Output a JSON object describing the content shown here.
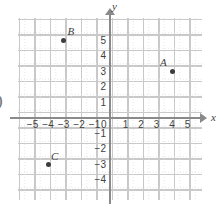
{
  "edge_artifact": ")",
  "chart_data": {
    "type": "scatter",
    "title": "",
    "xlabel": "x",
    "ylabel": "y",
    "xlim": [
      -5.6,
      5.9
    ],
    "ylim": [
      -4.6,
      5.6
    ],
    "grid": true,
    "grid_major_step": 1,
    "grid_minor_step": 0.5,
    "legend": "none",
    "origin_label": "0",
    "xticks": [
      -5,
      -4,
      -3,
      -2,
      -1,
      1,
      2,
      3,
      4,
      5
    ],
    "xtick_labels": [
      "−5",
      "−4",
      "−3",
      "−2",
      "−1",
      "1",
      "2",
      "3",
      "4",
      "5"
    ],
    "yticks": [
      5,
      4,
      3,
      2,
      1,
      -1,
      -2,
      -3,
      -4
    ],
    "ytick_labels": [
      "5",
      "4",
      "3",
      "2",
      "1",
      "−1",
      "−2",
      "−3",
      "−4"
    ],
    "points": [
      {
        "label": "A",
        "x": 4,
        "y": 3,
        "label_dx": -12,
        "label_dy": -15
      },
      {
        "label": "B",
        "x": -3,
        "y": 5,
        "label_dx": 4,
        "label_dy": -15
      },
      {
        "label": "C",
        "x": -4,
        "y": -3,
        "label_dx": 3,
        "label_dy": -14
      }
    ],
    "colors": {
      "point": "#3d3d3d",
      "axis": "#8a8a8a",
      "grid_major": "#c9c9c9",
      "grid_minor": "#e2e2e2",
      "text": "#3f3f3f",
      "background": "#ffffff"
    }
  }
}
